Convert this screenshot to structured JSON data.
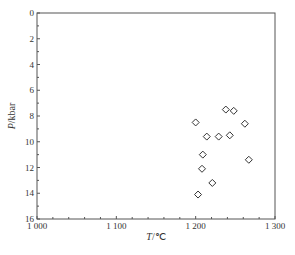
{
  "chart_data": {
    "type": "scatter",
    "title": "",
    "xlabel": "T/℃",
    "xlabel_var": "T",
    "xlabel_unit": "/℃",
    "ylabel": "P/kbar",
    "ylabel_var": "P",
    "ylabel_unit": "/kbar",
    "xlim": [
      1000,
      1300
    ],
    "ylim": [
      0,
      16
    ],
    "y_inverted": true,
    "grid": false,
    "legend": "none",
    "x_major_ticks": [
      1000,
      1100,
      1200,
      1300
    ],
    "x_tick_labels": [
      "1 000",
      "1 100",
      "1 200",
      "1 300"
    ],
    "x_minor_step": 20,
    "y_major_ticks": [
      0,
      2,
      4,
      6,
      8,
      10,
      12,
      14,
      16
    ],
    "y_tick_labels": [
      "0",
      "2",
      "4",
      "6",
      "8",
      "10",
      "12",
      "14",
      "16"
    ],
    "y_minor_step": 1,
    "marker": "diamond-open",
    "series": [
      {
        "name": "samples",
        "points": [
          {
            "x": 1200,
            "y": 8.5
          },
          {
            "x": 1214,
            "y": 9.6
          },
          {
            "x": 1229,
            "y": 9.6
          },
          {
            "x": 1243,
            "y": 9.5
          },
          {
            "x": 1238,
            "y": 7.5
          },
          {
            "x": 1248,
            "y": 7.6
          },
          {
            "x": 1262,
            "y": 8.6
          },
          {
            "x": 1267,
            "y": 11.4
          },
          {
            "x": 1209,
            "y": 11.0
          },
          {
            "x": 1208,
            "y": 12.1
          },
          {
            "x": 1221,
            "y": 13.2
          },
          {
            "x": 1203,
            "y": 14.1
          }
        ]
      }
    ]
  }
}
